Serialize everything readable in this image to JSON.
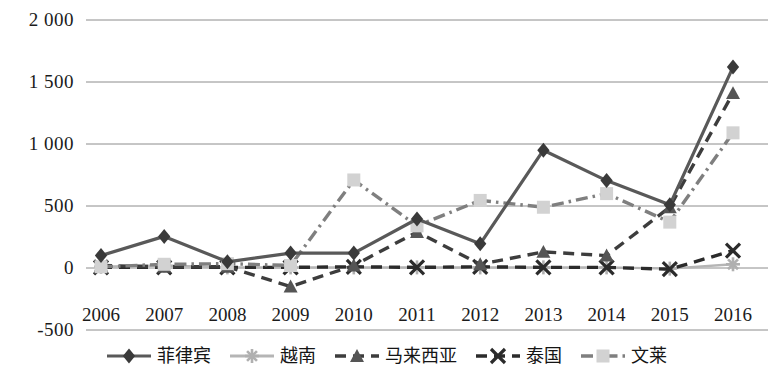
{
  "chart_data": {
    "type": "line",
    "title": "",
    "subtitle": "",
    "xlabel": "",
    "ylabel": "",
    "categories": [
      "2006",
      "2007",
      "2008",
      "2009",
      "2010",
      "2011",
      "2012",
      "2013",
      "2014",
      "2015",
      "2016"
    ],
    "ylim": [
      -500,
      2000
    ],
    "yticks": [
      "2 000",
      "1 500",
      "1 000",
      "500",
      "0",
      "-500"
    ],
    "ytick_values": [
      2000,
      1500,
      1000,
      500,
      0,
      -500
    ],
    "grid": "horizontal",
    "legend_position": "bottom",
    "series": [
      {
        "name": "菲律宾",
        "marker": "diamond",
        "line_style": "solid",
        "color": "#595959",
        "values": [
          100,
          255,
          50,
          120,
          120,
          395,
          195,
          950,
          705,
          510,
          1620
        ]
      },
      {
        "name": "越南",
        "marker": "asterisk",
        "line_style": "solid",
        "color": "#b5b5b5",
        "values": [
          10,
          20,
          5,
          5,
          5,
          5,
          5,
          5,
          5,
          -5,
          30
        ]
      },
      {
        "name": "马来西亚",
        "marker": "triangle",
        "line_style": "dashed",
        "color": "#3d3d3d",
        "values": [
          20,
          10,
          10,
          -150,
          20,
          290,
          30,
          130,
          100,
          490,
          1410
        ]
      },
      {
        "name": "泰国",
        "marker": "x",
        "line_style": "dashed",
        "color": "#2b2b2b",
        "values": [
          5,
          5,
          5,
          5,
          10,
          5,
          10,
          5,
          5,
          -10,
          140
        ]
      },
      {
        "name": "文莱",
        "marker": "square",
        "line_style": "dashdot",
        "color": "#7f7f7f",
        "values": [
          10,
          30,
          35,
          20,
          710,
          340,
          545,
          490,
          600,
          370,
          1090
        ]
      }
    ]
  }
}
